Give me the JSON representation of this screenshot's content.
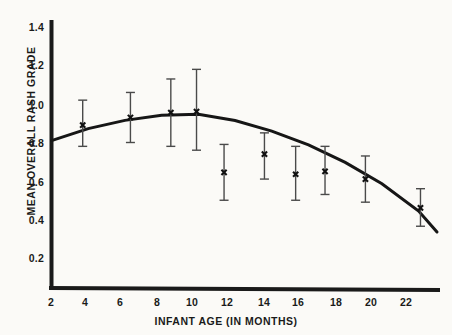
{
  "chart_data": {
    "type": "scatter",
    "title": "",
    "xlabel": "INFANT AGE (IN MONTHS)",
    "ylabel": "MEAN OVERALL RASH GRADE",
    "xlim": [
      2,
      23
    ],
    "ylim": [
      0,
      1.5
    ],
    "grid": false,
    "legend": null,
    "xticks": [
      2,
      4,
      6,
      8,
      10,
      12,
      14,
      16,
      18,
      20,
      22
    ],
    "xtick_labels": [
      "2",
      "4",
      "6",
      "8",
      "10",
      "12",
      "14",
      "16",
      "18",
      "20",
      "22"
    ],
    "yticks": [
      0.2,
      0.4,
      0.6,
      0.8,
      1.0,
      1.2,
      1.4
    ],
    "ytick_labels": [
      "0.2",
      "0.4",
      "0.6",
      "0.8",
      "1.0",
      "1.2",
      "1.4"
    ],
    "series": [
      {
        "name": "Mean overall rash grade with error bars",
        "marker": "x",
        "x": [
          3.7,
          6.3,
          8.5,
          9.9,
          11.4,
          13.6,
          15.3,
          16.9,
          19.1,
          22.1
        ],
        "y": [
          0.89,
          0.93,
          0.955,
          0.96,
          0.645,
          0.74,
          0.635,
          0.65,
          0.61,
          0.46
        ],
        "y_upper": [
          1.02,
          1.06,
          1.13,
          1.18,
          0.79,
          0.85,
          0.78,
          0.78,
          0.73,
          0.56
        ],
        "y_lower": [
          0.78,
          0.8,
          0.78,
          0.76,
          0.5,
          0.61,
          0.5,
          0.53,
          0.49,
          0.365
        ]
      },
      {
        "name": "Fitted quadratic trend curve",
        "marker": "none",
        "line": "solid",
        "x": [
          2.0,
          4.0,
          6.0,
          8.0,
          10.0,
          12.0,
          14.0,
          16.0,
          18.0,
          20.0,
          22.0,
          23.0
        ],
        "y": [
          0.81,
          0.872,
          0.915,
          0.941,
          0.947,
          0.914,
          0.859,
          0.788,
          0.697,
          0.586,
          0.444,
          0.335
        ]
      }
    ]
  },
  "axes": {
    "x_title": "INFANT AGE (IN MONTHS)",
    "y_title": "MEAN OVERALL RASH GRADE"
  },
  "colors": {
    "ink": "#1a1a1a",
    "background": "#fbfaf7",
    "errorbar": "#4a4a4a"
  }
}
